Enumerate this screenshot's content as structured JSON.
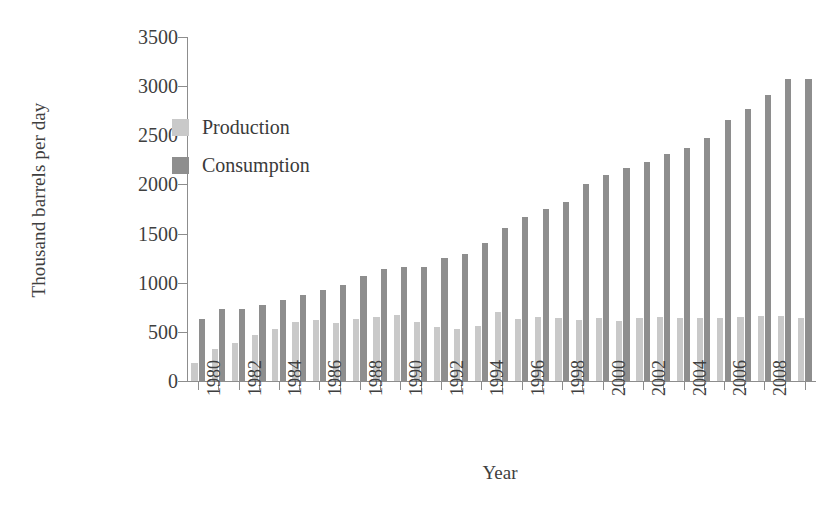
{
  "chart_data": {
    "type": "bar",
    "title": "",
    "xlabel": "Year",
    "ylabel": "Thousand barrels per day",
    "ylim": [
      0,
      3500
    ],
    "yticks": [
      0,
      500,
      1000,
      1500,
      2000,
      2500,
      3000,
      3500
    ],
    "grid": false,
    "legend_position": "upper-left-inside",
    "xtick_labels": [
      "1980",
      "1982",
      "1984",
      "1986",
      "1988",
      "1990",
      "1992",
      "1994",
      "1996",
      "1998",
      "2000",
      "2002",
      "2004",
      "2006",
      "2008"
    ],
    "xtick_rotation": 90,
    "categories": [
      "1980",
      "1981",
      "1982",
      "1983",
      "1984",
      "1985",
      "1986",
      "1987",
      "1988",
      "1989",
      "1990",
      "1991",
      "1992",
      "1993",
      "1994",
      "1995",
      "1996",
      "1997",
      "1998",
      "1999",
      "2000",
      "2001",
      "2002",
      "2003",
      "2004",
      "2005",
      "2006",
      "2007",
      "2008",
      "2009",
      "2010"
    ],
    "series": [
      {
        "name": "Production",
        "color": "#c9c9c9",
        "values": [
          180,
          330,
          385,
          470,
          525,
          600,
          620,
          595,
          630,
          650,
          670,
          605,
          550,
          530,
          560,
          700,
          635,
          655,
          640,
          625,
          640,
          610,
          645,
          650,
          645,
          640,
          645,
          650,
          665,
          660,
          645
        ]
      },
      {
        "name": "Consumption",
        "color": "#8e8e8e",
        "values": [
          635,
          730,
          730,
          775,
          820,
          880,
          930,
          975,
          1070,
          1135,
          1155,
          1160,
          1255,
          1290,
          1400,
          1555,
          1665,
          1755,
          1820,
          2005,
          2095,
          2170,
          2225,
          2305,
          2370,
          2470,
          2655,
          2770,
          2905,
          3070,
          3070
        ]
      }
    ]
  },
  "legend": {
    "items": [
      {
        "label": "Production",
        "color": "#c9c9c9"
      },
      {
        "label": "Consumption",
        "color": "#8e8e8e"
      }
    ]
  },
  "axes": {
    "y_title": "Thousand barrels per day",
    "x_title": "Year"
  }
}
